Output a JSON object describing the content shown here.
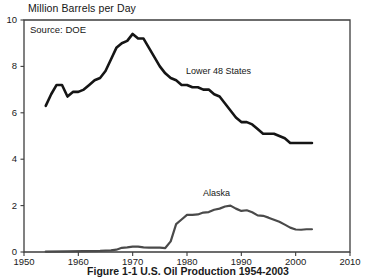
{
  "chart_data": {
    "type": "line",
    "title": "Million Barrels per Day",
    "xlabel": "",
    "ylabel": "Million Barrels per Day",
    "source_note": "Source: DOE",
    "caption": "Figure 1-1 U.S. Oil Production 1954-2003",
    "xlim": [
      1950,
      2010
    ],
    "ylim": [
      0,
      10
    ],
    "xticks": [
      1950,
      1960,
      1970,
      1980,
      1990,
      2000,
      2010
    ],
    "xtick_labels": [
      "1950",
      "1960",
      "1970",
      "1980",
      "1990",
      "2000",
      "2010"
    ],
    "yticks": [
      0,
      2,
      4,
      6,
      8,
      10
    ],
    "ytick_labels": [
      "0",
      "2",
      "4",
      "6",
      "8",
      "10"
    ],
    "grid": false,
    "legend_position": "inline-annotation",
    "line_color": "#151515",
    "alaska_color": "#4a4a4a",
    "frame_color": "#3d3d3d",
    "series": [
      {
        "name": "Lower 48 States",
        "label": "Lower 48 States",
        "color": "#151515",
        "x": [
          1954,
          1955,
          1956,
          1957,
          1958,
          1959,
          1960,
          1961,
          1962,
          1963,
          1964,
          1965,
          1966,
          1967,
          1968,
          1969,
          1970,
          1971,
          1972,
          1973,
          1974,
          1975,
          1976,
          1977,
          1978,
          1979,
          1980,
          1981,
          1982,
          1983,
          1984,
          1985,
          1986,
          1987,
          1988,
          1989,
          1990,
          1991,
          1992,
          1993,
          1994,
          1995,
          1996,
          1997,
          1998,
          1999,
          2000,
          2001,
          2002,
          2003
        ],
        "values": [
          6.3,
          6.8,
          7.2,
          7.2,
          6.7,
          6.9,
          6.9,
          7.0,
          7.2,
          7.4,
          7.5,
          7.8,
          8.3,
          8.8,
          9.0,
          9.1,
          9.4,
          9.2,
          9.2,
          8.8,
          8.4,
          8.0,
          7.7,
          7.5,
          7.4,
          7.2,
          7.2,
          7.1,
          7.1,
          7.0,
          7.0,
          6.8,
          6.7,
          6.4,
          6.1,
          5.8,
          5.6,
          5.6,
          5.5,
          5.3,
          5.1,
          5.1,
          5.1,
          5.0,
          4.9,
          4.7,
          4.7,
          4.7,
          4.7,
          4.7
        ]
      },
      {
        "name": "Alaska",
        "label": "Alaska",
        "color": "#4a4a4a",
        "x": [
          1954,
          1958,
          1961,
          1964,
          1966,
          1967,
          1968,
          1969,
          1970,
          1971,
          1972,
          1973,
          1974,
          1975,
          1976,
          1977,
          1978,
          1979,
          1980,
          1981,
          1982,
          1983,
          1984,
          1985,
          1986,
          1987,
          1988,
          1989,
          1990,
          1991,
          1992,
          1993,
          1994,
          1995,
          1996,
          1997,
          1998,
          1999,
          2000,
          2001,
          2002,
          2003
        ],
        "values": [
          0.02,
          0.03,
          0.04,
          0.05,
          0.07,
          0.1,
          0.18,
          0.2,
          0.23,
          0.23,
          0.2,
          0.19,
          0.19,
          0.19,
          0.17,
          0.46,
          1.2,
          1.4,
          1.6,
          1.6,
          1.62,
          1.7,
          1.72,
          1.82,
          1.87,
          1.96,
          2.0,
          1.87,
          1.77,
          1.8,
          1.71,
          1.58,
          1.56,
          1.48,
          1.39,
          1.3,
          1.18,
          1.05,
          0.97,
          0.96,
          0.98,
          0.98
        ]
      }
    ]
  }
}
